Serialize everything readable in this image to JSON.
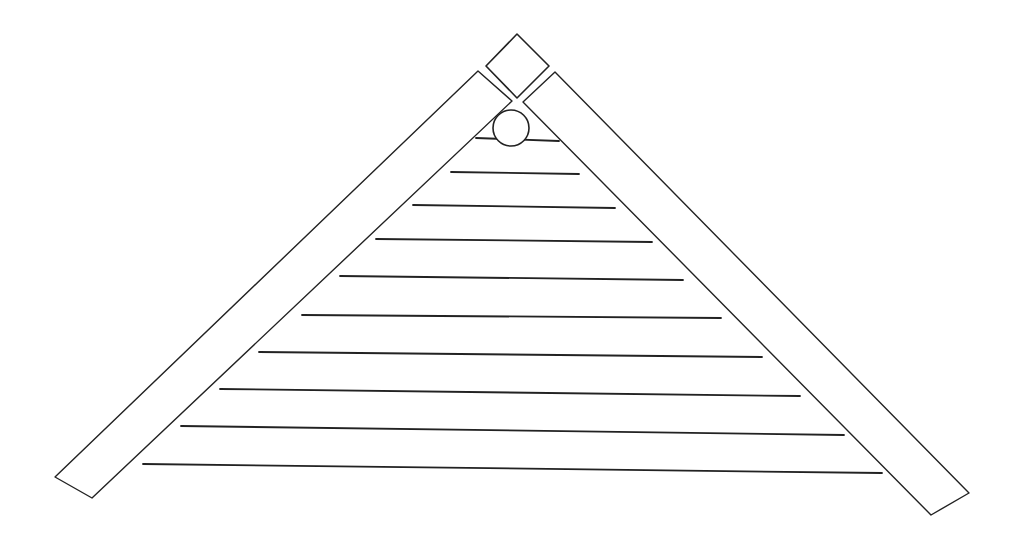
{
  "figure": {
    "stroke_color": "#222222",
    "background": "#ffffff",
    "apex_block": {
      "points": [
        [
          517,
          34
        ],
        [
          549,
          66
        ],
        [
          517,
          98
        ],
        [
          486,
          66
        ]
      ]
    },
    "left_rafter": {
      "points": [
        [
          478,
          71
        ],
        [
          512,
          101
        ],
        [
          92,
          498
        ],
        [
          55,
          477
        ]
      ]
    },
    "right_rafter": {
      "points": [
        [
          555,
          72
        ],
        [
          969,
          493
        ],
        [
          931,
          515
        ],
        [
          523,
          102
        ]
      ]
    },
    "vent": {
      "cx": 511,
      "cy": 128,
      "rx": 18,
      "ry": 18
    },
    "siding_lines": [
      {
        "x1": 476,
        "y1": 138,
        "x2": 559,
        "y2": 141
      },
      {
        "x1": 451,
        "y1": 172,
        "x2": 579,
        "y2": 174
      },
      {
        "x1": 413,
        "y1": 205,
        "x2": 615,
        "y2": 208
      },
      {
        "x1": 376,
        "y1": 239,
        "x2": 652,
        "y2": 242
      },
      {
        "x1": 340,
        "y1": 276,
        "x2": 683,
        "y2": 280
      },
      {
        "x1": 302,
        "y1": 315,
        "x2": 721,
        "y2": 318
      },
      {
        "x1": 259,
        "y1": 352,
        "x2": 762,
        "y2": 357
      },
      {
        "x1": 220,
        "y1": 389,
        "x2": 800,
        "y2": 396
      },
      {
        "x1": 181,
        "y1": 426,
        "x2": 844,
        "y2": 435
      },
      {
        "x1": 143,
        "y1": 464,
        "x2": 882,
        "y2": 473
      }
    ]
  }
}
